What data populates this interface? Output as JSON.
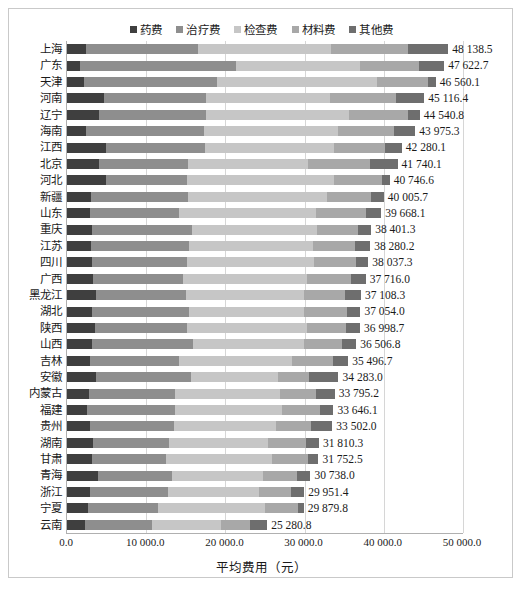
{
  "chart_data": {
    "type": "bar",
    "orientation": "horizontal",
    "stacked": true,
    "title": "",
    "xlabel": "平均费用（元）",
    "ylabel": "",
    "xlim": [
      0,
      50000
    ],
    "xticks": [
      "0.0",
      "10 000.0",
      "20 000.0",
      "30 000.0",
      "40 000.0",
      "50 000.0"
    ],
    "xtick_values": [
      0,
      10000,
      20000,
      30000,
      40000,
      50000
    ],
    "grid": true,
    "legend_position": "top-center",
    "legend": [
      "药费",
      "治疗费",
      "检查费",
      "材料费",
      "其他费"
    ],
    "series_colors": [
      "#3f3f3f",
      "#8e8e8e",
      "#c6c6c6",
      "#a8a8a8",
      "#6e6e6e"
    ],
    "categories": [
      "上海",
      "广东",
      "天津",
      "河南",
      "辽宁",
      "海南",
      "江西",
      "北京",
      "河北",
      "新疆",
      "山东",
      "重庆",
      "江苏",
      "四川",
      "广西",
      "黑龙江",
      "湖北",
      "陕西",
      "山西",
      "吉林",
      "安徽",
      "内蒙古",
      "福建",
      "贵州",
      "湖南",
      "甘肃",
      "青海",
      "浙江",
      "宁夏",
      "云南"
    ],
    "totals": [
      48138.5,
      47622.7,
      46560.1,
      45116.4,
      44540.8,
      43975.3,
      42280.1,
      41740.1,
      40746.6,
      40005.7,
      39668.1,
      38401.3,
      38280.2,
      38037.3,
      37716.0,
      37108.3,
      37054.0,
      36998.7,
      36506.8,
      35496.7,
      34283.0,
      33795.2,
      33646.1,
      33502.0,
      31810.3,
      31752.5,
      30738.0,
      29951.4,
      29879.8,
      25280.8
    ],
    "total_labels": [
      "48 138.5",
      "47 622.7",
      "46 560.1",
      "45 116.4",
      "44 540.8",
      "43 975.3",
      "42 280.1",
      "41 740.1",
      "40 746.6",
      "40 005.7",
      "39 668.1",
      "38 401.3",
      "38 280.2",
      "38 037.3",
      "37 716.0",
      "37 108.3",
      "37 054.0",
      "36 998.7",
      "36 506.8",
      "35 496.7",
      "34 283.0",
      "33 795.2",
      "33 646.1",
      "33 502.0",
      "31 810.3",
      "31 752.5",
      "30 738.0",
      "29 951.4",
      "29 879.8",
      "25 280.8"
    ],
    "series": [
      {
        "name": "药费",
        "values": [
          2400,
          1600,
          2200,
          4700,
          4000,
          2400,
          4900,
          4100,
          4900,
          3000,
          2900,
          3200,
          3000,
          3100,
          3300,
          3700,
          3200,
          3500,
          3100,
          2900,
          3700,
          2800,
          2500,
          2900,
          3300,
          3100,
          3900,
          2900,
          2600,
          2300
        ]
      },
      {
        "name": "治疗费",
        "values": [
          14200,
          19800,
          16800,
          12900,
          13500,
          14900,
          12500,
          11200,
          10200,
          12300,
          11200,
          12600,
          12400,
          12000,
          11400,
          11300,
          12200,
          11600,
          12800,
          11300,
          11900,
          10900,
          11100,
          10600,
          9600,
          9400,
          9300,
          9900,
          8900,
          8400
        ]
      },
      {
        "name": "检查费",
        "values": [
          16700,
          15600,
          20200,
          15600,
          18100,
          16900,
          16300,
          15100,
          18600,
          17500,
          17300,
          15800,
          15600,
          16100,
          15600,
          14900,
          14500,
          15200,
          14000,
          14200,
          11000,
          13200,
          13600,
          12900,
          12500,
          13400,
          11600,
          11400,
          13500,
          8700
        ]
      },
      {
        "name": "材料费",
        "values": [
          9700,
          7500,
          6400,
          8300,
          7400,
          7100,
          6400,
          7800,
          6100,
          5600,
          6400,
          5200,
          5400,
          5300,
          5600,
          5200,
          5400,
          4900,
          4800,
          5200,
          4000,
          4600,
          4700,
          4400,
          4800,
          4500,
          4300,
          4100,
          4200,
          3700
        ]
      },
      {
        "name": "其他费",
        "values": [
          5138.5,
          3122.7,
          960.1,
          3616.4,
          1540.8,
          2675.3,
          2180.1,
          3540.1,
          946.6,
          1605.7,
          1868.1,
          1601.3,
          1880.2,
          1537.3,
          1816.0,
          2008.3,
          1754.0,
          1798.7,
          1806.8,
          1896.7,
          3683.0,
          2295.2,
          1746.1,
          2702.0,
          1610.3,
          1352.5,
          1638.0,
          1651.4,
          679.8,
          2180.8
        ]
      }
    ]
  }
}
